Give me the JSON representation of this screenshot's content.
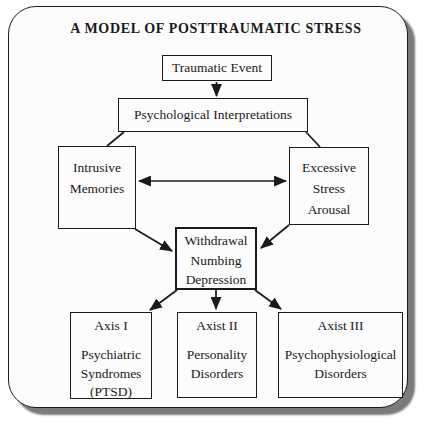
{
  "title": "A MODEL OF POSTTRAUMATIC STRESS",
  "nodes": {
    "traumatic_event": {
      "label": "Traumatic Event"
    },
    "psychological_interpretations": {
      "label": "Psychological Interpretations"
    },
    "intrusive_memories": {
      "lines": [
        "Intrusive",
        "Memories"
      ]
    },
    "excessive_stress_arousal": {
      "lines": [
        "Excessive",
        "Stress",
        "Arousal"
      ]
    },
    "withdrawal_numbing_depression": {
      "lines": [
        "Withdrawal",
        "Numbing",
        "Depression"
      ]
    },
    "axis_i": {
      "header": "Axis I",
      "lines": [
        "Psychiatric",
        "Syndromes",
        "(PTSD)"
      ]
    },
    "axis_ii": {
      "header": "Axist II",
      "lines": [
        "Personality",
        "Disorders"
      ]
    },
    "axis_iii": {
      "header": "Axist III",
      "lines": [
        "Psychophysiological",
        "Disorders"
      ]
    }
  },
  "colors": {
    "line": "#1a1a1a",
    "shadow": "#7b7b7b",
    "frame_fill": "#fcfcfc",
    "page_background": "#ffffff",
    "text": "#1a1a1a"
  }
}
